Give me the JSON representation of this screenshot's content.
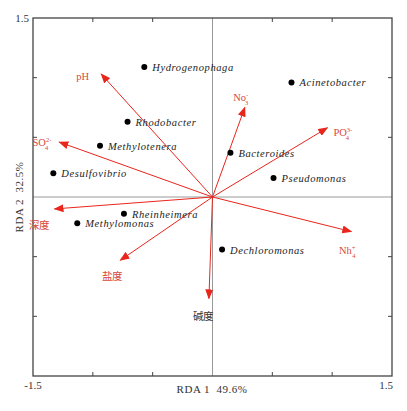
{
  "chart_data": {
    "type": "scatter",
    "subtype": "RDA biplot",
    "title": "",
    "xlabel": "RDA 1  49.6%",
    "ylabel": "RDA 2  32.5%",
    "xlim": [
      -1.5,
      1.5
    ],
    "ylim": [
      -1.5,
      1.5
    ],
    "x_tick_labels": [
      "-1.5",
      "1.5"
    ],
    "y_tick_labels": [
      "1.5",
      "-1.5"
    ],
    "grid": false,
    "zero_lines": true,
    "species": [
      {
        "name": "Hydrogenophaga",
        "x": -0.57,
        "y": 1.09
      },
      {
        "name": "Acinetobacter",
        "x": 0.66,
        "y": 0.96
      },
      {
        "name": "Rhodobacter",
        "x": -0.71,
        "y": 0.63
      },
      {
        "name": "Methylotenera",
        "x": -0.94,
        "y": 0.43
      },
      {
        "name": "Bacteroides",
        "x": 0.15,
        "y": 0.37
      },
      {
        "name": "Pseudomonas",
        "x": 0.51,
        "y": 0.16
      },
      {
        "name": "Desulfovibrio",
        "x": -1.33,
        "y": 0.2
      },
      {
        "name": "Rheinheimera",
        "x": -0.74,
        "y": -0.14
      },
      {
        "name": "Methylomonas",
        "x": -1.13,
        "y": -0.22
      },
      {
        "name": "Dechloromonas",
        "x": 0.08,
        "y": -0.44
      }
    ],
    "env_vectors": [
      {
        "name": "pH",
        "x": -0.93,
        "y": 1.03
      },
      {
        "name": "No3-",
        "label": "No",
        "sub": "3",
        "sup": "-",
        "x": 0.27,
        "y": 0.75
      },
      {
        "name": "PO4 3-",
        "label": "PO",
        "sub": "4",
        "sup": "3-",
        "x": 0.96,
        "y": 0.58
      },
      {
        "name": "SO4 2-",
        "label": "SO",
        "sub": "4",
        "sup": "2-",
        "x": -1.28,
        "y": 0.46
      },
      {
        "name": "深度",
        "x": -1.32,
        "y": -0.1
      },
      {
        "name": "Nh4+",
        "label": "Nh",
        "sub": "4",
        "sup": "+",
        "x": 1.16,
        "y": -0.29
      },
      {
        "name": "盐度",
        "x": -0.77,
        "y": -0.53
      },
      {
        "name": "碱度",
        "x": -0.03,
        "y": -0.85
      }
    ],
    "colors": {
      "vector": "#e8261c",
      "vector_label": "#d9483b",
      "alkalinity_label": "#333333",
      "species_point": "#000000",
      "frame": "#444444",
      "zero_line": "#999999"
    }
  }
}
